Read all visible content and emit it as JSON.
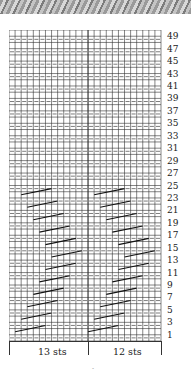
{
  "figure": {
    "type": "knitting-chart",
    "photo_strip": "knit-fabric-texture",
    "stitches": 25,
    "rows": 50,
    "sections": [
      {
        "label": "13 sts",
        "stitches": 13
      },
      {
        "label": "12 sts",
        "stitches": 12
      }
    ],
    "row_labels": [
      "49",
      "47",
      "45",
      "43",
      "41",
      "39",
      "37",
      "35",
      "33",
      "31",
      "29",
      "27",
      "25",
      "23",
      "21",
      "19",
      "17",
      "15",
      "13",
      "11",
      "9",
      "7",
      "5",
      "3",
      "1"
    ],
    "page_mark": "-"
  }
}
